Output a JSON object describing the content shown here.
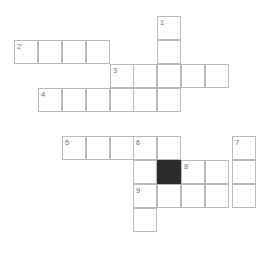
{
  "header": {
    "title": "",
    "color": "#e8e8e8"
  },
  "puzzle": {
    "type": "crossword",
    "cell_size": 24,
    "grid_line_color": "#b9b9b9",
    "block_color": "#2b2b2b",
    "number_color": "#6e6e6e",
    "background": "#ffffff",
    "width": 273,
    "height": 254,
    "numbers_visible": [
      "1",
      "2",
      "3",
      "4",
      "5",
      "6",
      "7",
      "8",
      "9"
    ],
    "block_count": 1,
    "cells": [
      {
        "x": 157,
        "y": 16,
        "number": "1",
        "letter": "",
        "black": false
      },
      {
        "x": 157,
        "y": 40,
        "number": "",
        "letter": "",
        "black": false
      },
      {
        "x": 14,
        "y": 40,
        "number": "2",
        "letter": "",
        "black": false
      },
      {
        "x": 38,
        "y": 40,
        "number": "",
        "letter": "",
        "black": false
      },
      {
        "x": 62,
        "y": 40,
        "number": "",
        "letter": "",
        "black": false
      },
      {
        "x": 86,
        "y": 40,
        "number": "",
        "letter": "",
        "black": false
      },
      {
        "x": 110,
        "y": 64,
        "number": "3",
        "letter": "",
        "black": false
      },
      {
        "x": 133,
        "y": 64,
        "number": "",
        "letter": "",
        "black": false
      },
      {
        "x": 157,
        "y": 64,
        "number": "",
        "letter": "",
        "black": false
      },
      {
        "x": 181,
        "y": 64,
        "number": "",
        "letter": "",
        "black": false
      },
      {
        "x": 205,
        "y": 64,
        "number": "",
        "letter": "",
        "black": false
      },
      {
        "x": 38,
        "y": 88,
        "number": "4",
        "letter": "",
        "black": false
      },
      {
        "x": 62,
        "y": 88,
        "number": "",
        "letter": "",
        "black": false
      },
      {
        "x": 86,
        "y": 88,
        "number": "",
        "letter": "",
        "black": false
      },
      {
        "x": 110,
        "y": 88,
        "number": "",
        "letter": "",
        "black": false
      },
      {
        "x": 133,
        "y": 88,
        "number": "",
        "letter": "",
        "black": false
      },
      {
        "x": 157,
        "y": 88,
        "number": "",
        "letter": "",
        "black": false
      },
      {
        "x": 62,
        "y": 136,
        "number": "5",
        "letter": "",
        "black": false
      },
      {
        "x": 86,
        "y": 136,
        "number": "",
        "letter": "",
        "black": false
      },
      {
        "x": 110,
        "y": 136,
        "number": "",
        "letter": "",
        "black": false
      },
      {
        "x": 133,
        "y": 136,
        "number": "6",
        "letter": "",
        "black": false
      },
      {
        "x": 157,
        "y": 136,
        "number": "",
        "letter": "",
        "black": false
      },
      {
        "x": 232,
        "y": 136,
        "number": "7",
        "letter": "",
        "black": false
      },
      {
        "x": 133,
        "y": 160,
        "number": "",
        "letter": "",
        "black": false
      },
      {
        "x": 157,
        "y": 160,
        "number": "",
        "letter": "",
        "black": true
      },
      {
        "x": 181,
        "y": 160,
        "number": "8",
        "letter": "",
        "black": false
      },
      {
        "x": 205,
        "y": 160,
        "number": "",
        "letter": "",
        "black": false
      },
      {
        "x": 232,
        "y": 160,
        "number": "",
        "letter": "",
        "black": false
      },
      {
        "x": 133,
        "y": 184,
        "number": "9",
        "letter": "",
        "black": false
      },
      {
        "x": 157,
        "y": 184,
        "number": "",
        "letter": "",
        "black": false
      },
      {
        "x": 181,
        "y": 184,
        "number": "",
        "letter": "",
        "black": false
      },
      {
        "x": 205,
        "y": 184,
        "number": "",
        "letter": "",
        "black": false
      },
      {
        "x": 232,
        "y": 184,
        "number": "",
        "letter": "",
        "black": false
      },
      {
        "x": 133,
        "y": 208,
        "number": "",
        "letter": "",
        "black": false
      }
    ]
  }
}
